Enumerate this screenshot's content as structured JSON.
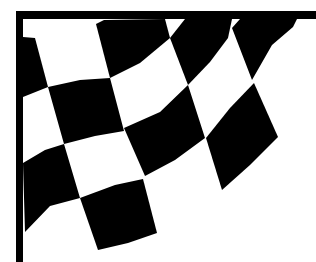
{
  "image": {
    "subject": "Checkered racing flag",
    "description": "Black and white checkered flag waving from a black pole",
    "width": 316,
    "height": 262,
    "colors": {
      "background": "#ffffff",
      "ink": "#000000"
    },
    "pole": {
      "vertical": [
        16,
        11,
        7,
        251
      ],
      "horizontal": [
        16,
        11,
        300,
        8
      ]
    },
    "checks": [
      "23,37 35,38 48,87 23,97",
      "96,24 104,20 165,19 170,38 140,63 110,78",
      "185,19 232,19 228,38 210,62 188,85 170,38",
      "240,19 297,19 293,27 272,45 252,80 232,28",
      "48,87 80,80 110,78 124,131 95,136 64,144",
      "124,128 160,112 188,85 205,138 175,160 145,176",
      "206,138 230,108 254,83 278,137 250,165 222,190",
      "23,163 45,150 64,144 80,198 50,206 25,232",
      "80,198 115,185 143,179 157,233 128,243 98,250"
    ]
  }
}
